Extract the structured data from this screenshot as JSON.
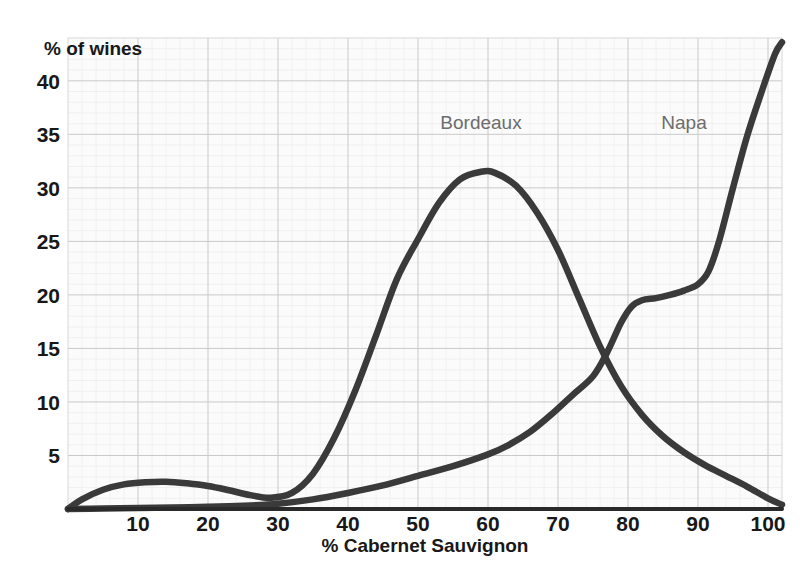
{
  "chart_data": {
    "type": "line",
    "title": "",
    "xlabel": "% Cabernet Sauvignon",
    "ylabel": "% of wines",
    "xlim": [
      0,
      102
    ],
    "ylim": [
      0,
      44
    ],
    "grid": true,
    "legend_position": "inline-annotation",
    "xticks": [
      10,
      20,
      30,
      40,
      50,
      60,
      70,
      80,
      90,
      100
    ],
    "xtick_labels": [
      "10",
      "20",
      "30",
      "40",
      "50",
      "60",
      "70",
      "80",
      "90",
      "100"
    ],
    "yticks": [
      5,
      10,
      15,
      20,
      25,
      30,
      35,
      40
    ],
    "ytick_labels": [
      "5",
      "10",
      "15",
      "20",
      "25",
      "30",
      "35",
      "40"
    ],
    "annotations": [
      {
        "text": "Bordeaux",
        "x": 59,
        "y": 35.5
      },
      {
        "text": "Napa",
        "x": 88,
        "y": 35.5
      }
    ],
    "series": [
      {
        "name": "Bordeaux",
        "color": "#3a3a3a",
        "x": [
          0,
          2,
          5,
          8,
          11,
          14,
          17,
          20,
          23,
          26,
          29,
          32,
          35,
          38,
          41,
          44,
          47,
          50,
          53,
          56,
          59,
          61,
          64,
          67,
          70,
          73,
          76,
          79,
          82,
          85,
          88,
          91,
          94,
          97,
          100,
          102
        ],
        "values": [
          0.0,
          0.9,
          1.8,
          2.3,
          2.5,
          2.55,
          2.4,
          2.15,
          1.75,
          1.3,
          1.05,
          1.5,
          3.3,
          6.6,
          11.0,
          16.2,
          21.5,
          25.2,
          28.6,
          30.8,
          31.5,
          31.4,
          30.2,
          27.7,
          24.2,
          19.7,
          15.2,
          11.5,
          8.8,
          6.8,
          5.3,
          4.1,
          3.1,
          2.1,
          1.0,
          0.4
        ]
      },
      {
        "name": "Napa",
        "color": "#3a3a3a",
        "x": [
          0,
          5,
          10,
          15,
          20,
          25,
          30,
          35,
          40,
          45,
          50,
          55,
          60,
          63,
          66,
          69,
          72,
          75,
          77,
          79,
          80.5,
          82,
          84,
          86,
          88,
          90,
          91.5,
          93,
          95,
          97,
          99,
          101,
          102
        ],
        "values": [
          0.0,
          0.05,
          0.1,
          0.15,
          0.2,
          0.3,
          0.5,
          0.9,
          1.5,
          2.2,
          3.1,
          4.0,
          5.1,
          6.0,
          7.2,
          8.8,
          10.6,
          12.4,
          14.6,
          17.4,
          18.9,
          19.5,
          19.7,
          20.0,
          20.4,
          21.0,
          22.2,
          25.0,
          30.0,
          34.8,
          38.8,
          42.5,
          43.6
        ]
      }
    ]
  },
  "axis": {
    "y_title": "% of wines",
    "x_title": "% Cabernet Sauvignon"
  }
}
